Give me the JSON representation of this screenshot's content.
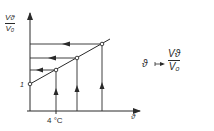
{
  "diagram": {
    "y_axis_label": {
      "numerator": "Vϑ",
      "denominator": "V₀"
    },
    "x_axis_label": "ϑ",
    "x_tick_label": "4 °C",
    "y_tick_label": "1",
    "mapping": {
      "variable": "ϑ",
      "arrow": "↦",
      "numerator": "Vϑ",
      "denominator": "V₀"
    },
    "colors": {
      "ink": "#2a2a2a",
      "background": "#ffffff"
    },
    "points": [
      {
        "x": 30,
        "y": 84,
        "label": "1"
      },
      {
        "x": 56,
        "y": 70
      },
      {
        "x": 77,
        "y": 58
      },
      {
        "x": 102,
        "y": 44
      }
    ]
  }
}
